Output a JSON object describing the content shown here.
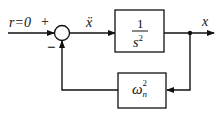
{
  "diagram": {
    "input_label": "r=0",
    "plus_sign": "+",
    "minus_sign": "−",
    "signal_label": "ẍ",
    "output_label": "x",
    "forward_block": {
      "numerator": "1",
      "denominator": "s",
      "denominator_exp": "2"
    },
    "feedback_block": {
      "symbol": "ω",
      "subscript": "n",
      "superscript": "2"
    }
  }
}
